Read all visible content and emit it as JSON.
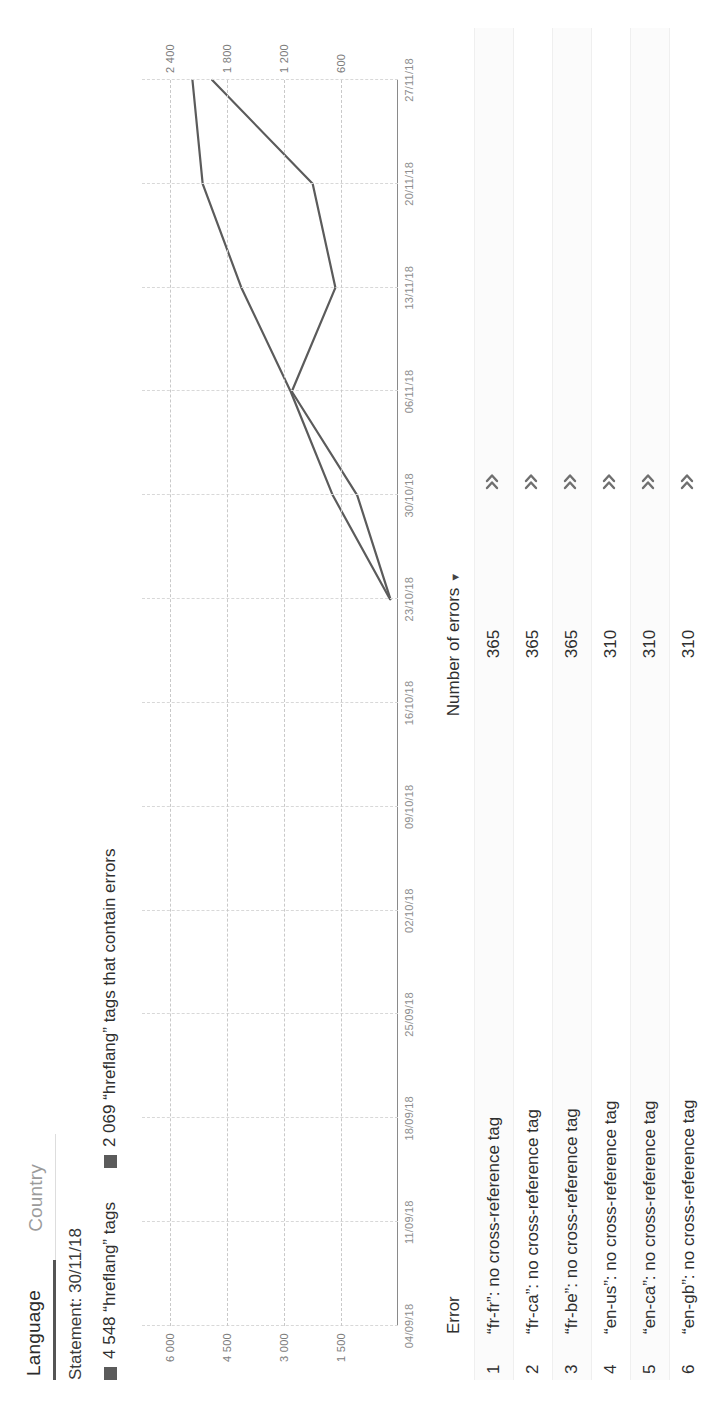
{
  "tabs": [
    {
      "label": "Language",
      "active": true
    },
    {
      "label": "Country",
      "active": false
    }
  ],
  "statement": "Statement: 30/11/18",
  "legend": [
    {
      "label": "4 548 “hreflang” tags",
      "color": "#5b5b5b"
    },
    {
      "label": "2 069 “hreflang” tags that contain errors",
      "color": "#5b5b5b"
    }
  ],
  "chart_data": {
    "type": "line",
    "title": "",
    "xlabel": "",
    "ylabel": "",
    "grid": true,
    "legend_position": "top",
    "categories": [
      "04/09/18",
      "11/09/18",
      "18/09/18",
      "25/09/18",
      "02/10/18",
      "09/10/18",
      "16/10/18",
      "23/10/18",
      "30/10/18",
      "06/11/18",
      "13/11/18",
      "20/11/18",
      "27/11/18"
    ],
    "y_left_ticks": [
      "6 000",
      "4 500",
      "3 000",
      "1 500"
    ],
    "y_right_ticks": [
      "2 400",
      "1 800",
      "1 200",
      "600"
    ],
    "ylim_left": [
      0,
      6750
    ],
    "ylim_right": [
      0,
      2700
    ],
    "series": [
      {
        "name": "“hreflang” tags",
        "axis": "left",
        "color": "#5b5b5b",
        "x": [
          "23/10/18",
          "30/10/18",
          "06/11/18",
          "13/11/18",
          "20/11/18",
          "27/11/18"
        ],
        "values": [
          210,
          1720,
          2830,
          4130,
          5150,
          5420
        ]
      },
      {
        "name": "“hreflang” tags that contain errors",
        "axis": "right",
        "color": "#5b5b5b",
        "x": [
          "23/10/18",
          "30/10/18",
          "06/11/18",
          "13/11/18",
          "20/11/18",
          "27/11/18"
        ],
        "values": [
          80,
          430,
          1120,
          660,
          900,
          1960
        ]
      }
    ]
  },
  "table": {
    "columns": {
      "index": "",
      "error": "Error",
      "number_of_errors": "Number of errors",
      "sort_caret": "▼",
      "more": ""
    },
    "rows": [
      {
        "index": "1",
        "error": "“fr-fr”: no cross-reference tag",
        "number_of_errors": "365"
      },
      {
        "index": "2",
        "error": "“fr-ca”: no cross-reference tag",
        "number_of_errors": "365"
      },
      {
        "index": "3",
        "error": "“fr-be”: no cross-reference tag",
        "number_of_errors": "365"
      },
      {
        "index": "4",
        "error": "“en-us”: no cross-reference tag",
        "number_of_errors": "310"
      },
      {
        "index": "5",
        "error": "“en-ca”: no cross-reference tag",
        "number_of_errors": "310"
      },
      {
        "index": "6",
        "error": "“en-gb”: no cross-reference tag",
        "number_of_errors": "310"
      }
    ]
  },
  "colors": {
    "series": "#5b5b5b",
    "grid": "#c9c9c9",
    "text": "#2f2f2f",
    "muted": "#8d8d8d",
    "tab_active_underline": "#555555"
  }
}
